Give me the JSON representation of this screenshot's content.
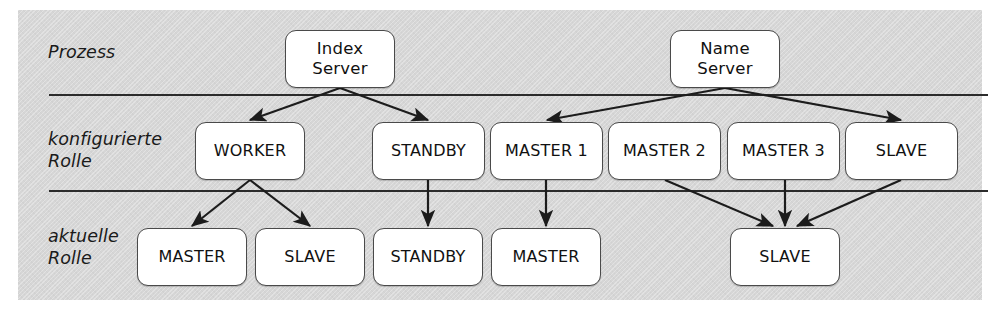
{
  "diagram": {
    "title_present": false,
    "background_color": "#d6d6d6",
    "node_fill": "#ffffff",
    "node_border": "#4a4a4a",
    "line_color": "#2b2b2b",
    "row_labels": [
      {
        "id": "prozess",
        "text": "Prozess"
      },
      {
        "id": "konfigurierte-rolle",
        "text": "konfigurierte\nRolle"
      },
      {
        "id": "aktuelle-rolle",
        "text": "aktuelle\nRolle"
      }
    ],
    "rows": {
      "process": {
        "label": "Prozess",
        "nodes": [
          {
            "id": "index-server",
            "text": "Index\nServer",
            "x": 285,
            "y": 30,
            "w": 110,
            "h": 58
          },
          {
            "id": "name-server",
            "text": "Name\nServer",
            "x": 670,
            "y": 30,
            "w": 110,
            "h": 58
          }
        ]
      },
      "configured_role": {
        "label": "konfigurierte Rolle",
        "nodes": [
          {
            "id": "worker",
            "text": "WORKER",
            "x": 195,
            "y": 122,
            "w": 110,
            "h": 58
          },
          {
            "id": "standby",
            "text": "STANDBY",
            "x": 372,
            "y": 122,
            "w": 113,
            "h": 58
          },
          {
            "id": "master-1",
            "text": "MASTER 1",
            "x": 490,
            "y": 122,
            "w": 113,
            "h": 58
          },
          {
            "id": "master-2",
            "text": "MASTER 2",
            "x": 608,
            "y": 122,
            "w": 113,
            "h": 58
          },
          {
            "id": "master-3",
            "text": "MASTER 3",
            "x": 727,
            "y": 122,
            "w": 113,
            "h": 58
          },
          {
            "id": "slave-configured",
            "text": "SLAVE",
            "x": 845,
            "y": 122,
            "w": 113,
            "h": 58
          }
        ]
      },
      "actual_role": {
        "label": "aktuelle Rolle",
        "nodes": [
          {
            "id": "master-actual-1",
            "text": "MASTER",
            "x": 137,
            "y": 228,
            "w": 110,
            "h": 58
          },
          {
            "id": "slave-actual-1",
            "text": "SLAVE",
            "x": 255,
            "y": 228,
            "w": 110,
            "h": 58
          },
          {
            "id": "standby-actual",
            "text": "STANDBY",
            "x": 373,
            "y": 228,
            "w": 110,
            "h": 58
          },
          {
            "id": "master-actual-2",
            "text": "MASTER",
            "x": 491,
            "y": 228,
            "w": 110,
            "h": 58
          },
          {
            "id": "slave-actual-2",
            "text": "SLAVE",
            "x": 730,
            "y": 228,
            "w": 110,
            "h": 58
          }
        ]
      }
    },
    "edges": [
      {
        "from": "index-server",
        "to": "worker",
        "x1": 340,
        "y1": 88,
        "x2": 250,
        "y2": 120
      },
      {
        "from": "index-server",
        "to": "standby",
        "x1": 340,
        "y1": 88,
        "x2": 428,
        "y2": 120
      },
      {
        "from": "name-server",
        "to": "master-1",
        "x1": 725,
        "y1": 88,
        "x2": 547,
        "y2": 120
      },
      {
        "from": "name-server",
        "to": "slave-configured",
        "x1": 725,
        "y1": 88,
        "x2": 901,
        "y2": 120
      },
      {
        "from": "worker",
        "to": "master-actual-1",
        "x1": 250,
        "y1": 180,
        "x2": 192,
        "y2": 226
      },
      {
        "from": "worker",
        "to": "slave-actual-1",
        "x1": 250,
        "y1": 180,
        "x2": 310,
        "y2": 226
      },
      {
        "from": "standby",
        "to": "standby-actual",
        "x1": 428,
        "y1": 180,
        "x2": 428,
        "y2": 226
      },
      {
        "from": "master-1",
        "to": "master-actual-2",
        "x1": 546,
        "y1": 180,
        "x2": 546,
        "y2": 226
      },
      {
        "from": "master-2",
        "to": "slave-actual-2",
        "x1": 665,
        "y1": 180,
        "x2": 773,
        "y2": 226
      },
      {
        "from": "master-3",
        "to": "slave-actual-2",
        "x1": 785,
        "y1": 180,
        "x2": 785,
        "y2": 226
      },
      {
        "from": "slave-configured",
        "to": "slave-actual-2",
        "x1": 901,
        "y1": 180,
        "x2": 797,
        "y2": 226
      }
    ],
    "dividers": [
      {
        "id": "divider-process-configured",
        "y": 94
      },
      {
        "id": "divider-configured-actual",
        "y": 190
      }
    ]
  }
}
